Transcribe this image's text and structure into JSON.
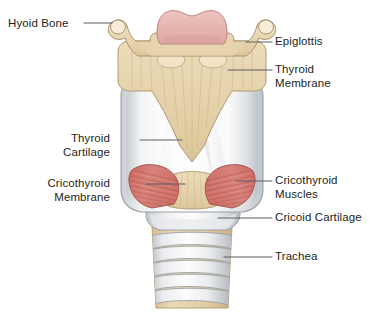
{
  "figure": {
    "background_color": "#ffffff",
    "width": 384,
    "height": 322
  },
  "palette": {
    "bone_fill": "#e8d5b0",
    "bone_fill_light": "#f0e2c6",
    "bone_outline": "#a8906a",
    "membrane_fill": "#e5d2ac",
    "membrane_outline": "#b09a70",
    "cartilage_fill": "#fbfbfb",
    "cartilage_shade": "#d3d6da",
    "cartilage_outline": "#9aa0a6",
    "epiglottis_fill": "#e7b6b1",
    "epiglottis_outline": "#bc8580",
    "muscle_fill": "#cf6f68",
    "muscle_fill_light": "#dd908a",
    "muscle_outline": "#a2504a",
    "trachea_ring_fill": "#fafafa",
    "trachea_ring_shade": "#c9cdd2",
    "trachea_band_fill": "#e3cda6",
    "leader_line": "#5b5f66",
    "text_color": "#231f20"
  },
  "labels": [
    {
      "id": "hyoid-bone",
      "text": "Hyoid Bone",
      "side": "left",
      "lines": [
        "Hyoid Bone"
      ]
    },
    {
      "id": "thyroid-cartilage",
      "text": "Thyroid Cartilage",
      "side": "left",
      "lines": [
        "Thyroid",
        "Cartilage"
      ]
    },
    {
      "id": "cricothyroid-membrane",
      "text": "Cricothyroid Membrane",
      "side": "left",
      "lines": [
        "Cricothyroid",
        "Membrane"
      ]
    },
    {
      "id": "epiglottis",
      "text": "Epiglottis",
      "side": "right",
      "lines": [
        "Epiglottis"
      ]
    },
    {
      "id": "thyroid-membrane",
      "text": "Thyroid Membrane",
      "side": "right",
      "lines": [
        "Thyroid",
        "Membrane"
      ]
    },
    {
      "id": "cricothyroid-muscles",
      "text": "Cricothyroid Muscles",
      "side": "right",
      "lines": [
        "Cricothyroid",
        "Muscles"
      ]
    },
    {
      "id": "cricoid-cartilage",
      "text": "Cricoid Cartilage",
      "side": "right",
      "lines": [
        "Cricoid Cartilage"
      ]
    },
    {
      "id": "trachea",
      "text": "Trachea",
      "side": "right",
      "lines": [
        "Trachea"
      ]
    }
  ],
  "label_text": {
    "hyoid_bone": "Hyoid Bone",
    "thyroid_cartilage_l1": "Thyroid",
    "thyroid_cartilage_l2": "Cartilage",
    "cricothyroid_membrane_l1": "Cricothyroid",
    "cricothyroid_membrane_l2": "Membrane",
    "epiglottis": "Epiglottis",
    "thyroid_membrane_l1": "Thyroid",
    "thyroid_membrane_l2": "Membrane",
    "cricothyroid_muscles_l1": "Cricothyroid",
    "cricothyroid_muscles_l2": "Muscles",
    "cricoid_cartilage": "Cricoid Cartilage",
    "trachea": "Trachea"
  },
  "anatomy_parts": [
    {
      "name": "hyoid-bone",
      "color": "#e8d5b0",
      "description": "U-shaped bone with bulbous greater horn tips at top left and top right"
    },
    {
      "name": "epiglottis",
      "color": "#e7b6b1",
      "description": "pink leaf-shaped flap centered above the thyroid membrane"
    },
    {
      "name": "thyroid-membrane",
      "color": "#e5d2ac",
      "description": "tan fibrous sheet between hyoid bone and thyroid cartilage"
    },
    {
      "name": "thyroid-cartilage",
      "color": "#fbfbfb",
      "description": "large white shield-shaped cartilage with superior V notch"
    },
    {
      "name": "cricothyroid-membrane",
      "color": "#e5d2ac",
      "description": "tan band between thyroid and cricoid cartilage, centre front"
    },
    {
      "name": "cricothyroid-muscles",
      "color": "#cf6f68",
      "description": "paired red fan-shaped muscles flanking the cricothyroid membrane"
    },
    {
      "name": "cricoid-cartilage",
      "color": "#fbfbfb",
      "description": "white ring cartilage below the thyroid cartilage"
    },
    {
      "name": "trachea",
      "color": "#e3cda6",
      "description": "tube of alternating white cartilage rings and tan membrane bands"
    }
  ],
  "trachea_rings": {
    "count": 6
  }
}
